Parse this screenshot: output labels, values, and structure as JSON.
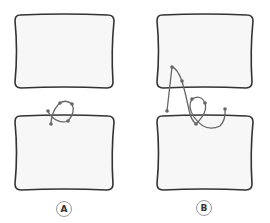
{
  "diagram": {
    "colors": {
      "box_fill": "#f7f7f7",
      "box_stroke": "#333333",
      "curve_stroke": "#666666",
      "point_fill": "#666666",
      "label_border": "#9a9a9a",
      "label_text": "#333333"
    },
    "panels": [
      {
        "id": "A",
        "label": "A",
        "boxes": [
          {
            "name": "top-box",
            "x": 14,
            "y": 15,
            "w": 100,
            "h": 73
          },
          {
            "name": "bottom-box",
            "x": 14,
            "y": 116,
            "w": 100,
            "h": 74
          }
        ],
        "curve_points": [
          [
            51,
            124
          ],
          [
            52,
            117
          ],
          [
            60,
            103
          ],
          [
            72,
            104
          ],
          [
            68,
            121
          ],
          [
            52,
            117
          ],
          [
            48,
            111
          ]
        ]
      },
      {
        "id": "B",
        "label": "B",
        "boxes": [
          {
            "name": "top-box",
            "x": 156,
            "y": 15,
            "w": 97,
            "h": 73
          },
          {
            "name": "bottom-box",
            "x": 156,
            "y": 116,
            "w": 97,
            "h": 74
          }
        ],
        "curve_points": [
          [
            167,
            111
          ],
          [
            172,
            67
          ],
          [
            182,
            81
          ],
          [
            192,
            99
          ],
          [
            205,
            103
          ],
          [
            196,
            124
          ],
          [
            225,
            109
          ]
        ]
      }
    ]
  }
}
